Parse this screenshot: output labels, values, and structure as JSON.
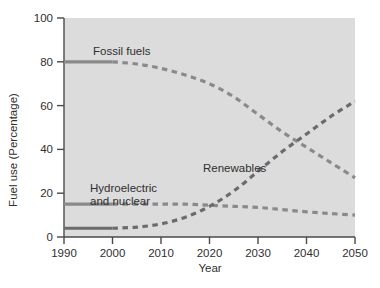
{
  "chart_data": {
    "type": "line",
    "title": "",
    "xlabel": "Year",
    "ylabel": "Fuel use (Percentage)",
    "xlim": [
      1990,
      2050
    ],
    "ylim": [
      0,
      100
    ],
    "xticks": [
      "1990",
      "2000",
      "2010",
      "2020",
      "2030",
      "2040",
      "2050"
    ],
    "yticks": [
      "0",
      "20",
      "40",
      "60",
      "80",
      "100"
    ],
    "grid": false,
    "legend_position": "inline-annotations",
    "historical_end_year": 2000,
    "note": "Solid segments are historical data (1990-2000); dashed segments are projections (2000-2050).",
    "series": [
      {
        "name": "Fossil fuels",
        "label": "Fossil fuels",
        "color": "#8a8a8a",
        "x": [
          1990,
          1995,
          2000,
          2005,
          2010,
          2015,
          2020,
          2025,
          2030,
          2035,
          2040,
          2045,
          2050
        ],
        "values": [
          80,
          80,
          80,
          79,
          77,
          74,
          70,
          64,
          56,
          48,
          41,
          34,
          27
        ]
      },
      {
        "name": "Hydroelectric and nuclear",
        "label": "Hydroelectric\nand nuclear",
        "color": "#8a8a8a",
        "x": [
          1990,
          1995,
          2000,
          2005,
          2010,
          2015,
          2020,
          2025,
          2030,
          2035,
          2040,
          2045,
          2050
        ],
        "values": [
          15,
          15,
          15,
          15,
          15,
          15,
          14.5,
          14,
          13.5,
          12.5,
          11.5,
          10.7,
          10
        ]
      },
      {
        "name": "Renewables",
        "label": "Renewables",
        "color": "#6b6b6b",
        "x": [
          1990,
          1995,
          2000,
          2005,
          2010,
          2015,
          2020,
          2025,
          2030,
          2035,
          2040,
          2045,
          2050
        ],
        "values": [
          4,
          4,
          4,
          4.5,
          6,
          9,
          14,
          21,
          30,
          39,
          47,
          55,
          62
        ]
      }
    ],
    "annotations": [
      {
        "text": "Fossil fuels",
        "x_px": 93,
        "y_px": 55
      },
      {
        "text": "Renewables",
        "x_px": 203,
        "y_px": 172
      },
      {
        "text": "Hydroelectric",
        "x_px": 90,
        "y_px": 192
      },
      {
        "text": "and nuclear",
        "x_px": 90,
        "y_px": 205
      }
    ],
    "colors": {
      "plot_background": "#dcdcdc",
      "axis": "#4a4a4a",
      "line_fossil": "#8a8a8a",
      "line_hydro_nuclear": "#8a8a8a",
      "line_renewables": "#6b6b6b",
      "text": "#2f2f2f"
    }
  }
}
